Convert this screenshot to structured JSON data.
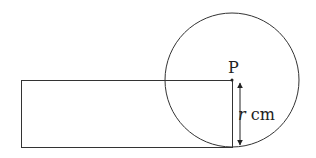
{
  "diagram": {
    "point_label": "P",
    "dimension_var": "r",
    "dimension_unit": " cm",
    "stroke_color": "#333333"
  }
}
